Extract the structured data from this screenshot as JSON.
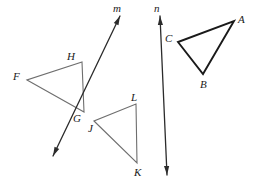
{
  "figure": {
    "canvas": {
      "width": 257,
      "height": 184,
      "background": "#ffffff"
    },
    "styles": {
      "triangle_light_color": "#6e6e6e",
      "triangle_dark_color": "#1a1a1a",
      "line_color": "#2b2b2b",
      "label_color": "#1a1a1a",
      "triangle_light_width": 1.1,
      "triangle_dark_width": 1.9,
      "line_width": 1.3
    },
    "triangles": [
      {
        "name": "triangle-abc",
        "shade": "dark",
        "vertices": [
          {
            "id": "A",
            "label": "A",
            "x": 234,
            "y": 21,
            "label_x": 238,
            "label_y": 14
          },
          {
            "id": "B",
            "label": "B",
            "x": 203,
            "y": 74,
            "label_x": 200,
            "label_y": 79
          },
          {
            "id": "C",
            "label": "C",
            "x": 178,
            "y": 42,
            "label_x": 165,
            "label_y": 33
          }
        ]
      },
      {
        "name": "triangle-fgh",
        "shade": "light",
        "vertices": [
          {
            "id": "F",
            "label": "F",
            "x": 27,
            "y": 80,
            "label_x": 13,
            "label_y": 71
          },
          {
            "id": "G",
            "label": "G",
            "x": 84,
            "y": 112,
            "label_x": 73,
            "label_y": 113
          },
          {
            "id": "H",
            "label": "H",
            "x": 82,
            "y": 62,
            "label_x": 67,
            "label_y": 51
          }
        ]
      },
      {
        "name": "triangle-jkl",
        "shade": "light",
        "vertices": [
          {
            "id": "J",
            "label": "J",
            "x": 94,
            "y": 121,
            "label_x": 88,
            "label_y": 123
          },
          {
            "id": "K",
            "label": "K",
            "x": 137,
            "y": 163,
            "label_x": 134,
            "label_y": 167
          },
          {
            "id": "L",
            "label": "L",
            "x": 136,
            "y": 104,
            "label_x": 131,
            "label_y": 92
          }
        ]
      }
    ],
    "lines": [
      {
        "name": "line-m",
        "label": "m",
        "label_x": 113,
        "label_y": 3,
        "x1": 120,
        "y1": 16,
        "x2": 53,
        "y2": 156,
        "arrow_start": true,
        "arrow_end": true
      },
      {
        "name": "line-n",
        "label": "n",
        "label_x": 154,
        "label_y": 3,
        "x1": 160,
        "y1": 16,
        "x2": 167,
        "y2": 175,
        "arrow_start": true,
        "arrow_end": true
      }
    ]
  }
}
